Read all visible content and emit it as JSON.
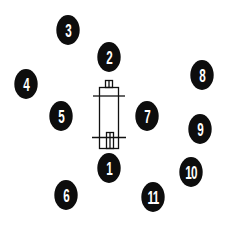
{
  "diagram": {
    "type": "numbered-callout-layout",
    "colors": {
      "marker_fill": "#0d0d0d",
      "marker_text": "#ffffff",
      "line": "#111111",
      "background": "#ffffff"
    },
    "center_device": {
      "name": "cylindrical-part-diagram"
    },
    "markers": [
      {
        "label": "1",
        "x": 109,
        "y": 168
      },
      {
        "label": "2",
        "x": 109,
        "y": 57
      },
      {
        "label": "3",
        "x": 68,
        "y": 30
      },
      {
        "label": "4",
        "x": 26,
        "y": 84
      },
      {
        "label": "5",
        "x": 61,
        "y": 116
      },
      {
        "label": "6",
        "x": 66,
        "y": 195
      },
      {
        "label": "7",
        "x": 147,
        "y": 116
      },
      {
        "label": "8",
        "x": 202,
        "y": 75
      },
      {
        "label": "9",
        "x": 200,
        "y": 129
      },
      {
        "label": "10",
        "x": 191,
        "y": 172
      },
      {
        "label": "11",
        "x": 153,
        "y": 197
      }
    ]
  }
}
